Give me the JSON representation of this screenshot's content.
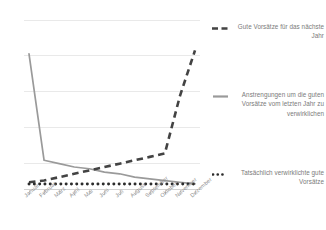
{
  "chart_data": {
    "type": "line",
    "title": "",
    "subtitle": "",
    "xlabel": "",
    "ylabel": "",
    "grid": true,
    "legend_position": "right",
    "ylim": [
      0,
      100
    ],
    "yticks": [
      0,
      20,
      40,
      60,
      80,
      100
    ],
    "categories": [
      "Januar",
      "Februar",
      "März",
      "April",
      "Mai",
      "Juni",
      "Juli",
      "August",
      "September",
      "Oktober",
      "November",
      "Dezember"
    ],
    "series": [
      {
        "name": "Gute Vorsätze für das nächste Jahr",
        "style": "dashed",
        "color": "#434343",
        "values": [
          4,
          5,
          7,
          9,
          11,
          13,
          15,
          17,
          19,
          21,
          55,
          82
        ]
      },
      {
        "name": "Anstrengungen um die guten Vorsätze vom letzten Jahr zu verwirklichen",
        "style": "solid",
        "color": "#9a9a9a",
        "values": [
          80,
          17,
          15,
          13,
          12,
          10,
          9,
          7,
          6,
          5,
          4,
          3
        ]
      },
      {
        "name": "Tatsächlich verwirklichte gute Vorsätze",
        "style": "dotted",
        "color": "#2b2b2b",
        "values": [
          3,
          3,
          3,
          3,
          3,
          3,
          3,
          3,
          3,
          3,
          3,
          3
        ]
      }
    ]
  },
  "legend": {
    "entries": [
      {
        "label": "Gute Vorsätze für das nächste Jahr",
        "marker": "dashed-line-marker",
        "color": "#434343"
      },
      {
        "label": "Anstrengungen um die guten Vorsätze vom letzten Jahr zu verwirklichen",
        "marker": "solid-line-marker",
        "color": "#9a9a9a"
      },
      {
        "label": "Tatsächlich verwirklichte gute Vorsätze",
        "marker": "dotted-line-marker",
        "color": "#2b2b2b"
      }
    ]
  },
  "axes": {
    "x_categories": [
      "Januar",
      "Februar",
      "März",
      "April",
      "Mai",
      "Juni",
      "Juli",
      "August",
      "September",
      "Oktober",
      "November",
      "Dezember"
    ],
    "gridline_color": "#e9e9e9",
    "axis_color": "#d2d2d2"
  }
}
